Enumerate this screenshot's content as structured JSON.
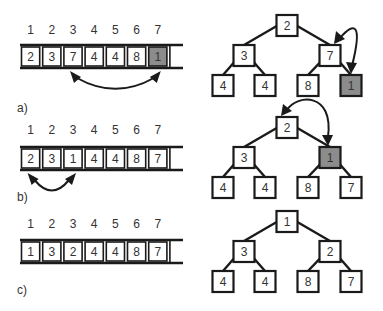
{
  "colors": {
    "stroke": "#1a1a1a",
    "highlight_fill": "#8c8c8c",
    "cell_fill": "#ffffff",
    "text": "#333333"
  },
  "panels": [
    {
      "label": "a)",
      "index_labels": [
        "1",
        "2",
        "3",
        "4",
        "5",
        "6",
        "7"
      ],
      "array": [
        "2",
        "3",
        "7",
        "4",
        "4",
        "8",
        "1"
      ],
      "highlight_index": 6,
      "array_swap": [
        2,
        6
      ],
      "tree": [
        "2",
        "3",
        "7",
        "4",
        "4",
        "8",
        "1"
      ],
      "tree_highlight": 6,
      "tree_swap": [
        2,
        6
      ]
    },
    {
      "label": "b)",
      "index_labels": [
        "1",
        "2",
        "3",
        "4",
        "5",
        "6",
        "7"
      ],
      "array": [
        "2",
        "3",
        "1",
        "4",
        "4",
        "8",
        "7"
      ],
      "highlight_index": null,
      "array_swap": [
        0,
        2
      ],
      "tree": [
        "2",
        "3",
        "1",
        "4",
        "4",
        "8",
        "7"
      ],
      "tree_highlight": 2,
      "tree_swap": [
        0,
        2
      ]
    },
    {
      "label": "c)",
      "index_labels": [
        "1",
        "2",
        "3",
        "4",
        "5",
        "6",
        "7"
      ],
      "array": [
        "1",
        "3",
        "2",
        "4",
        "4",
        "8",
        "7"
      ],
      "highlight_index": null,
      "array_swap": null,
      "tree": [
        "1",
        "3",
        "2",
        "4",
        "4",
        "8",
        "7"
      ],
      "tree_highlight": null,
      "tree_swap": null
    }
  ]
}
